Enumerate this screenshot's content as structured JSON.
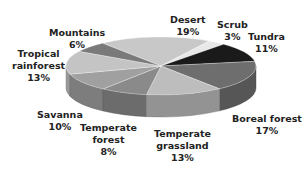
{
  "chart_data": {
    "type": "pie",
    "title": "",
    "style": "3d",
    "categories": [
      "Desert",
      "Scrub",
      "Tundra",
      "Boreal forest",
      "Temperate grassland",
      "Temperate forest",
      "Savanna",
      "Tropical rainforest",
      "Mountains"
    ],
    "values": [
      19,
      3,
      11,
      17,
      13,
      8,
      10,
      13,
      6
    ],
    "labels": [
      {
        "name": "Desert",
        "pct": "19%"
      },
      {
        "name": "Scrub",
        "pct": "3%"
      },
      {
        "name": "Tundra",
        "pct": "11%"
      },
      {
        "name": "Boreal forest",
        "pct": "17%"
      },
      {
        "name": "Temperate grassland",
        "pct": "13%"
      },
      {
        "name": "Temperate forest",
        "pct": "8%"
      },
      {
        "name": "Savanna",
        "pct": "10%"
      },
      {
        "name": "Tropical rainforest",
        "pct": "13%"
      },
      {
        "name": "Mountains",
        "pct": "6%"
      }
    ],
    "colors": [
      "#c8c8c8",
      "#e8e8e8",
      "#1a1a1a",
      "#6e6e6e",
      "#bdbdbd",
      "#8a8a8a",
      "#a0a0a0",
      "#c4c4c4",
      "#7a7a7a"
    ],
    "legend": "none"
  },
  "labels_text": {
    "desert": [
      "Desert",
      "19%"
    ],
    "scrub": [
      "Scrub",
      "3%"
    ],
    "tundra": [
      "Tundra",
      "11%"
    ],
    "boreal": [
      "Boreal forest",
      "17%"
    ],
    "tgrass": [
      "Temperate",
      "grassland",
      "13%"
    ],
    "tforest": [
      "Temperate",
      "forest",
      "8%"
    ],
    "savanna": [
      "Savanna",
      "10%"
    ],
    "tropical": [
      "Tropical",
      "rainforest",
      "13%"
    ],
    "mountains": [
      "Mountains",
      "6%"
    ]
  }
}
